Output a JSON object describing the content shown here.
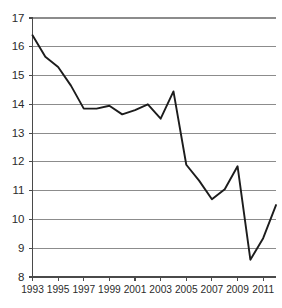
{
  "chart_data": {
    "type": "line",
    "title": "",
    "subtitle": "",
    "xlabel": "",
    "ylabel": "",
    "grid": true,
    "legend": "none",
    "xlim": [
      1993,
      2012
    ],
    "ylim": [
      8,
      17
    ],
    "ytick_step": 1,
    "xtick_step": 2,
    "yticks": [
      17,
      16,
      15,
      14,
      13,
      12,
      11,
      10,
      9,
      8
    ],
    "ytick_labels": [
      "17",
      "16",
      "15",
      "14",
      "13",
      "12",
      "11",
      "10",
      "9",
      "8"
    ],
    "xticks": [
      1993,
      1995,
      1997,
      1999,
      2001,
      2003,
      2005,
      2007,
      2009,
      2011
    ],
    "xtick_labels": [
      "1993",
      "1995",
      "1997",
      "1999",
      "2001",
      "2003",
      "2005",
      "2007",
      "2009",
      "2011"
    ],
    "x": [
      1993,
      1994,
      1995,
      1996,
      1997,
      1998,
      1999,
      2000,
      2001,
      2002,
      2003,
      2004,
      2005,
      2006,
      2007,
      2008,
      2009,
      2010,
      2011,
      2012
    ],
    "values": [
      16.4,
      15.65,
      15.3,
      14.65,
      13.85,
      13.85,
      13.95,
      13.65,
      13.8,
      14.0,
      13.5,
      14.45,
      11.9,
      11.35,
      10.7,
      11.05,
      11.85,
      8.6,
      9.35,
      10.5
    ],
    "series": [
      {
        "name": "series-1",
        "color": "#1c1c1c",
        "values": [
          16.4,
          15.65,
          15.3,
          14.65,
          13.85,
          13.85,
          13.95,
          13.65,
          13.8,
          14.0,
          13.5,
          14.45,
          11.9,
          11.35,
          10.7,
          11.05,
          11.85,
          8.6,
          9.35,
          10.5
        ]
      }
    ],
    "annotations": [],
    "colors": {
      "line": "#1c1c1c",
      "grid": "#8c8c8c",
      "axis": "#4a4a4a",
      "text": "#2b2b2b",
      "background": "#ffffff"
    }
  }
}
